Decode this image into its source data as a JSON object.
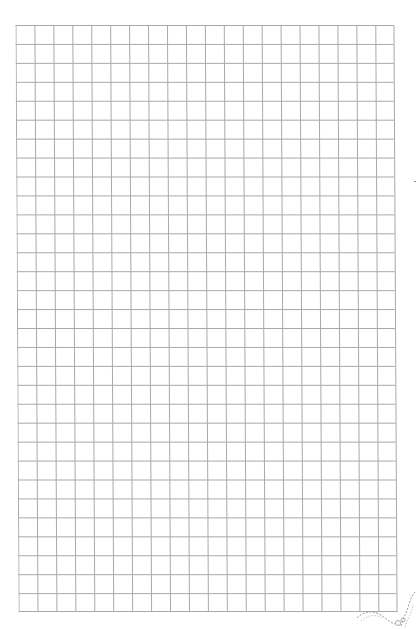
{
  "page": {
    "type": "graph-paper",
    "grid": {
      "columns": 20,
      "rows": 31,
      "line_color": "#a9a9a9",
      "background_color": "#ffffff"
    },
    "decorations": {
      "bottom_right_ornament": "ornament-icon"
    }
  }
}
